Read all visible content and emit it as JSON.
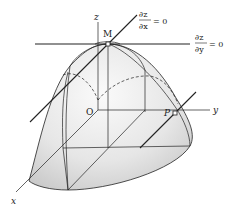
{
  "figure": {
    "axes": {
      "x_label": "x",
      "y_label": "y",
      "z_label": "z",
      "origin_label": "O"
    },
    "points": {
      "max_point": "M",
      "surface_point": "P"
    },
    "annotations": {
      "dzdx": {
        "num": "∂z",
        "den": "∂x",
        "eq": "= 0"
      },
      "dzdy": {
        "num": "∂z",
        "den": "∂y",
        "eq": "= 0"
      }
    },
    "colors": {
      "surface_light": "#f4f4f4",
      "surface_dark": "#cfcfcf",
      "line": "#222222"
    }
  }
}
